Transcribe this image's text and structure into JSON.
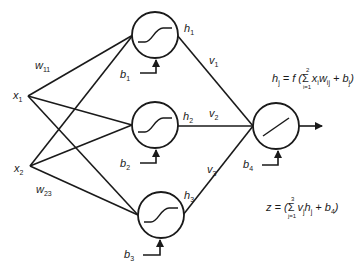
{
  "diagram": {
    "type": "neural-network",
    "inputs": [
      {
        "id": "x1",
        "label": "x",
        "sub": "1",
        "x": 28,
        "y": 96
      },
      {
        "id": "x2",
        "label": "x",
        "sub": "2",
        "x": 30,
        "y": 166
      }
    ],
    "hidden": [
      {
        "id": "h1",
        "label": "h",
        "sub": "1",
        "cx": 155,
        "cy": 35,
        "bias": "b",
        "bias_sub": "1",
        "activation": "sigmoid"
      },
      {
        "id": "h2",
        "label": "h",
        "sub": "2",
        "cx": 155,
        "cy": 125,
        "bias": "b",
        "bias_sub": "2",
        "activation": "sigmoid"
      },
      {
        "id": "h3",
        "label": "h",
        "sub": "3",
        "cx": 161,
        "cy": 215,
        "bias": "b",
        "bias_sub": "3",
        "activation": "sigmoid"
      }
    ],
    "output": {
      "id": "out",
      "cx": 276,
      "cy": 126,
      "bias": "b",
      "bias_sub": "4",
      "activation": "linear"
    },
    "weights": [
      {
        "label": "w",
        "sub": "11"
      },
      {
        "label": "w",
        "sub": "23"
      }
    ],
    "output_weights": [
      {
        "label": "v",
        "sub": "1"
      },
      {
        "label": "v",
        "sub": "2"
      },
      {
        "label": "v",
        "sub": "3"
      }
    ],
    "formulas": {
      "hidden": {
        "lhs": "h",
        "lhs_sub": "j",
        "eq": " = f (",
        "sum_upper": "2",
        "sum_lower": "i=1",
        "body": "x",
        "body_sub1": "i",
        "body2": "w",
        "body_sub2": "ij",
        "plus": " + b",
        "plus_sub": "j",
        "close": ")"
      },
      "output": {
        "lhs": "z",
        "eq": " = (",
        "sum_upper": "3",
        "sum_lower": "j=1",
        "body": "v",
        "body_sub1": "j",
        "body2": "h",
        "body_sub2": "j",
        "plus": " + b",
        "plus_sub": "4",
        "close": ")"
      }
    }
  }
}
